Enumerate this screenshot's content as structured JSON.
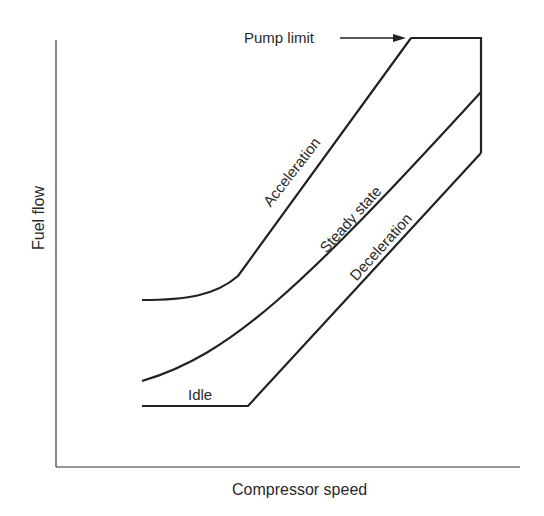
{
  "diagram": {
    "x_axis_label": "Compressor speed",
    "y_axis_label": "Fuel flow",
    "annotations": {
      "pump_limit": "Pump limit",
      "idle": "Idle"
    },
    "curves": [
      {
        "name": "acceleration",
        "label": "Acceleration"
      },
      {
        "name": "steady-state",
        "label": "Steady state"
      },
      {
        "name": "deceleration",
        "label": "Deceleration"
      }
    ],
    "line_color": "#222222"
  }
}
